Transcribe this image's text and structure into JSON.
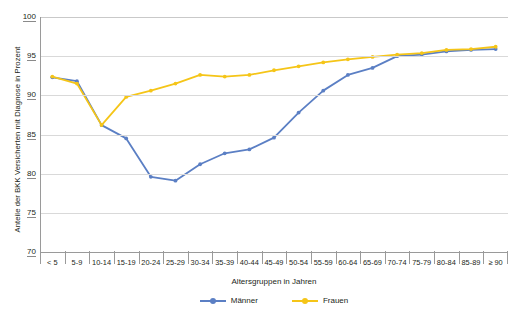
{
  "chart_data": {
    "type": "line",
    "title": "",
    "xlabel": "Altersgruppen in Jahren",
    "ylabel": "Anteile der BKK Versicherten mit Diagnose in Prozent",
    "ylim": [
      70,
      100
    ],
    "yticks": [
      70,
      75,
      80,
      85,
      90,
      95,
      100
    ],
    "grid": true,
    "legend_position": "bottom",
    "categories": [
      "< 5",
      "5-9",
      "10-14",
      "15-19",
      "20-24",
      "25-29",
      "30-34",
      "35-39",
      "40-44",
      "45-49",
      "50-54",
      "55-59",
      "60-64",
      "65-69",
      "70-74",
      "75-79",
      "80-84",
      "85-89",
      "≥ 90"
    ],
    "series": [
      {
        "name": "Männer",
        "color": "#5b7fc4",
        "values": [
          92.3,
          91.8,
          86.2,
          84.5,
          79.6,
          79.1,
          81.2,
          82.6,
          83.1,
          84.6,
          87.8,
          90.6,
          92.6,
          93.5,
          95.0,
          95.2,
          95.6,
          95.8,
          95.9
        ]
      },
      {
        "name": "Frauen",
        "color": "#f5c518",
        "values": [
          92.4,
          91.5,
          86.2,
          89.8,
          90.6,
          91.5,
          92.6,
          92.4,
          92.6,
          93.2,
          93.7,
          94.2,
          94.6,
          94.9,
          95.2,
          95.4,
          95.8,
          95.9,
          96.2
        ]
      }
    ]
  },
  "legend": {
    "items": [
      {
        "label": "Männer",
        "color": "#5b7fc4"
      },
      {
        "label": "Frauen",
        "color": "#f5c518"
      }
    ]
  }
}
